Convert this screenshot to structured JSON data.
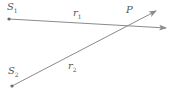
{
  "diagram": {
    "labels": {
      "s1": "S",
      "s1_sub": "1",
      "s2": "S",
      "s2_sub": "2",
      "r1": "r",
      "r1_sub": "1",
      "r2": "r",
      "r2_sub": "2",
      "p": "P"
    },
    "colors": {
      "line": "#8a8a8a",
      "point": "#6a6a6a",
      "text": "#555555"
    }
  }
}
